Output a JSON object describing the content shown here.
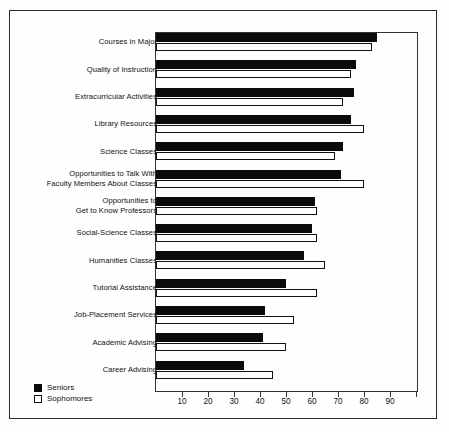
{
  "chart_data": {
    "type": "bar",
    "orientation": "horizontal",
    "title": "",
    "xlabel": "",
    "ylabel": "",
    "xlim": [
      0,
      100
    ],
    "xticks": [
      10,
      20,
      30,
      40,
      50,
      60,
      70,
      80,
      90
    ],
    "grid": false,
    "legend_position": "bottom-left",
    "categories": [
      "Courses in Major",
      "Quality of Instruction",
      "Extracurricular Activities",
      "Library Resources",
      "Science Classes",
      "Opportunities to Talk With\nFaculty Members About Classes",
      "Opportunities to\nGet to Know Professors",
      "Social-Science Classes",
      "Humanities Classes",
      "Tutorial Assistance",
      "Job-Placement Services",
      "Academic Advising",
      "Career Advising"
    ],
    "series": [
      {
        "name": "Seniors",
        "color": "#0b0b0b",
        "values": [
          85,
          77,
          76,
          75,
          72,
          71,
          61,
          60,
          57,
          50,
          42,
          41,
          34
        ]
      },
      {
        "name": "Sophomores",
        "color": "#ffffff",
        "values": [
          83,
          75,
          72,
          80,
          69,
          80,
          62,
          62,
          65,
          62,
          53,
          50,
          45
        ]
      }
    ]
  },
  "legend": {
    "items": [
      {
        "label": "Seniors",
        "swatch": "filled-black-square"
      },
      {
        "label": "Sophomores",
        "swatch": "outlined-white-square"
      }
    ]
  },
  "axis": {
    "tick_labels": [
      "10",
      "20",
      "30",
      "40",
      "50",
      "60",
      "70",
      "80",
      "90"
    ]
  }
}
